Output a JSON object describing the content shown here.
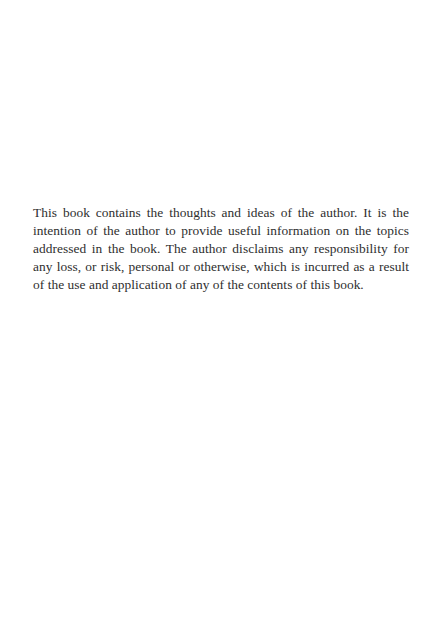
{
  "page": {
    "background": "#ffffff",
    "text_color": "#2e2e2e"
  },
  "disclaimer": {
    "lines": [
      "This book contains the thoughts and ideas of the author. It is the",
      "intention of the author to provide useful information on the topics",
      "addressed in the book. The author disclaims any responsibility for",
      "any loss, or risk, personal or otherwise, which is incurred as a result",
      "of the use and application of any of the contents of this book."
    ]
  }
}
